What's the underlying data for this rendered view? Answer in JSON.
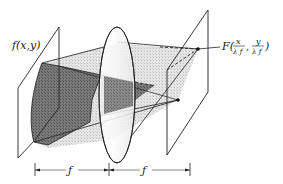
{
  "diagram": {
    "labels": {
      "input_function": "f(x,y)",
      "output_prefix": "F(",
      "output_x_num": "x",
      "output_y_num": "y",
      "output_den": "λ ƒ",
      "output_comma": ",",
      "output_suffix": ")"
    },
    "dimensions": {
      "first_distance": "ƒ",
      "second_distance": "ƒ"
    },
    "elements": [
      "input-plane",
      "input-aperture-field",
      "lens",
      "light-cone",
      "output-plane",
      "focal-point",
      "secondary-point",
      "dimension-lines"
    ],
    "colors": {
      "line": "#222222",
      "dark_fill": "#6e6e6e",
      "light_fill": "#dcdcdc",
      "lens_fill": "#f4f4f4",
      "background": "#ffffff"
    }
  }
}
